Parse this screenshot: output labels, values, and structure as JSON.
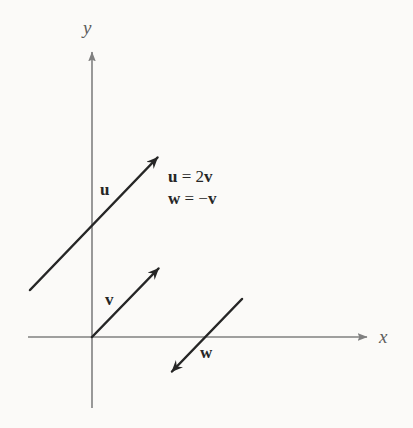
{
  "figure": {
    "kind": "vector-diagram",
    "background_color": "#fbfaf8",
    "axis_color": "#808080",
    "vector_color": "#262626",
    "text_color": "#262626",
    "axis_label_color": "#5d5d5d"
  },
  "axes": {
    "origin": {
      "x": 92,
      "y": 337
    },
    "x_axis": {
      "label": "x",
      "start": {
        "x": 28,
        "y": 337
      },
      "end": {
        "x": 372,
        "y": 337
      },
      "label_position": {
        "x": 379,
        "y": 327
      }
    },
    "y_axis": {
      "label": "y",
      "start": {
        "x": 92,
        "y": 408
      },
      "end": {
        "x": 92,
        "y": 47
      },
      "label_position": {
        "x": 83,
        "y": 18
      }
    }
  },
  "vectors": [
    {
      "name": "u",
      "label": "u",
      "tail": {
        "x": 30,
        "y": 290
      },
      "head": {
        "x": 163,
        "y": 152
      },
      "label_position": {
        "x": 100,
        "y": 181
      },
      "color": "#262626"
    },
    {
      "name": "v",
      "label": "v",
      "tail": {
        "x": 92,
        "y": 337
      },
      "head": {
        "x": 164,
        "y": 263
      },
      "label_position": {
        "x": 105,
        "y": 291
      },
      "color": "#262626"
    },
    {
      "name": "w",
      "label": "w",
      "tail": {
        "x": 242,
        "y": 299
      },
      "head": {
        "x": 166,
        "y": 378
      },
      "label_position": {
        "x": 200,
        "y": 344
      },
      "color": "#262626"
    }
  ],
  "equations": {
    "position": {
      "x": 168,
      "y": 166
    },
    "lines": [
      {
        "lhs": "u",
        "operator": "=",
        "rhs_scalar": "2",
        "rhs_vector": "v",
        "text": "u = 2v"
      },
      {
        "lhs": "w",
        "operator": "=",
        "rhs_scalar": "−",
        "rhs_vector": "v",
        "text": "w = −v"
      }
    ],
    "line1_lhs": "u",
    "line1_eq": " = 2",
    "line1_rhs": "v",
    "line2_lhs": "w",
    "line2_eq": " = −",
    "line2_rhs": "v"
  }
}
